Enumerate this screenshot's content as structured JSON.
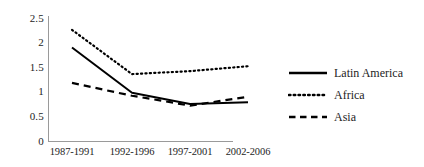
{
  "chart_data": {
    "type": "line",
    "title": "",
    "xlabel": "",
    "ylabel": "",
    "categories": [
      "1987-1991",
      "1992-1996",
      "1997-2001",
      "2002-2006"
    ],
    "ylim": [
      0,
      2.5
    ],
    "ytick_labels": [
      "2.5",
      "2",
      "1.5",
      "1",
      "0.5",
      "0"
    ],
    "ytick_values": [
      2.5,
      2,
      1.5,
      1,
      0.5,
      0
    ],
    "grid": false,
    "legend_position": "right",
    "series": [
      {
        "name": "Latin America",
        "style": "solid",
        "color": "#000000",
        "values": [
          1.9,
          0.98,
          0.75,
          0.79
        ]
      },
      {
        "name": "Africa",
        "style": "dotted",
        "color": "#000000",
        "values": [
          2.26,
          1.36,
          1.42,
          1.52
        ]
      },
      {
        "name": "Asia",
        "style": "dashed",
        "color": "#000000",
        "values": [
          1.18,
          0.92,
          0.72,
          0.9
        ]
      }
    ]
  },
  "legend": {
    "items": [
      {
        "label": "Latin America",
        "swatch": "solid-line-swatch"
      },
      {
        "label": "Africa",
        "swatch": "dotted-line-swatch"
      },
      {
        "label": "Asia",
        "swatch": "dashed-line-swatch"
      }
    ]
  }
}
